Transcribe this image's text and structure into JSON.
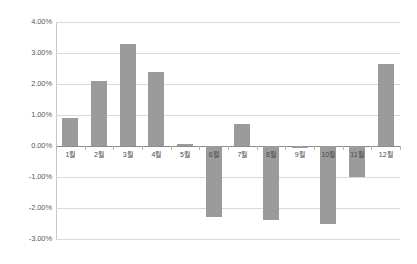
{
  "chart_data": {
    "type": "bar",
    "title": "",
    "xlabel": "",
    "ylabel": "",
    "categories": [
      "1월",
      "2월",
      "3월",
      "4월",
      "5월",
      "6월",
      "7월",
      "8월",
      "9월",
      "10월",
      "11월",
      "12월"
    ],
    "values": [
      0.9,
      2.1,
      3.3,
      2.4,
      0.05,
      -2.3,
      0.7,
      -2.4,
      -0.05,
      -2.5,
      -1.0,
      2.65
    ],
    "value_labels": [
      "0.90%",
      "2.10%",
      "3.30%",
      "2.40%",
      "0.05%",
      "-2.30%",
      "0.70%",
      "-2.40%",
      "-0.05%",
      "-2.50%",
      "-1.00%",
      "2.65%"
    ],
    "ylim": [
      -3.0,
      4.0
    ],
    "ytick_values": [
      4.0,
      3.0,
      2.0,
      1.0,
      0.0,
      -1.0,
      -2.0,
      -3.0
    ],
    "ytick_labels": [
      "4.00%",
      "3.00%",
      "2.00%",
      "1.00%",
      "0.00%",
      "-1.00%",
      "-2.00%",
      "-3.00%"
    ],
    "grid": true,
    "legend": false,
    "legend_position": "none",
    "series": [
      {
        "name": "",
        "color": "#9b9b9b",
        "values": [
          0.9,
          2.1,
          3.3,
          2.4,
          0.05,
          -2.3,
          0.7,
          -2.4,
          -0.05,
          -2.5,
          -1.0,
          2.65
        ]
      }
    ]
  },
  "axes": {
    "gridline_color": "#d9d9d9",
    "zero_line_color": "#8a8a8a",
    "axis_line_color": "#c8c8c8",
    "tick_color": "#b5b5b5"
  },
  "colors": {
    "background": "#ffffff",
    "bar": "#9b9b9b",
    "tick_text": "#5a5a5a"
  }
}
